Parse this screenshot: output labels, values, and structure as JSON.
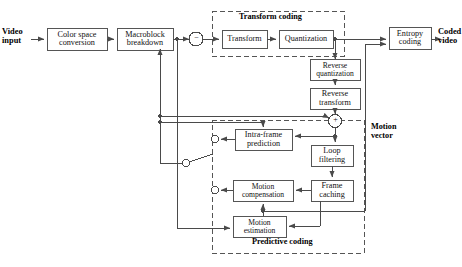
{
  "diagram": {
    "io_labels": {
      "input": "Video\ninput",
      "input_line1": "Video",
      "input_line2": "input",
      "output_line1": "Coded",
      "output_line2": "video"
    },
    "blocks": [
      {
        "id": "color_space",
        "line1": "Color space",
        "line2": "conversion"
      },
      {
        "id": "macroblock",
        "line1": "Macroblock",
        "line2": "breakdown"
      },
      {
        "id": "transform",
        "line1": "Transform",
        "line2": ""
      },
      {
        "id": "quantization",
        "line1": "Quantization",
        "line2": ""
      },
      {
        "id": "entropy_coding",
        "line1": "Entropy",
        "line2": "coding"
      },
      {
        "id": "reverse_quantization",
        "line1": "Reverse",
        "line2": "quantization"
      },
      {
        "id": "reverse_transform",
        "line1": "Reverse",
        "line2": "transform"
      },
      {
        "id": "loop_filtering",
        "line1": "Loop",
        "line2": "filtering"
      },
      {
        "id": "frame_caching",
        "line1": "Frame",
        "line2": "caching"
      },
      {
        "id": "intra_frame_prediction",
        "line1": "Intra-frame",
        "line2": "prediction"
      },
      {
        "id": "motion_compensation",
        "line1": "Motion",
        "line2": "compensation"
      },
      {
        "id": "motion_estimation",
        "line1": "Motion",
        "line2": "estimation"
      }
    ],
    "groups": [
      {
        "id": "transform_coding",
        "label": "Transform coding"
      },
      {
        "id": "predictive_coding",
        "label": "Predictive coding"
      },
      {
        "id": "motion_vector",
        "line1": "Motion",
        "line2": "vector"
      }
    ],
    "junctions": [
      {
        "id": "subtract_node",
        "sign": "−"
      },
      {
        "id": "add_node",
        "sign": "+"
      }
    ],
    "colors": {
      "line": "#4a4a4a",
      "box_border": "#555555",
      "dashed": "#555555",
      "text": "#111111",
      "background": "#ffffff"
    }
  }
}
